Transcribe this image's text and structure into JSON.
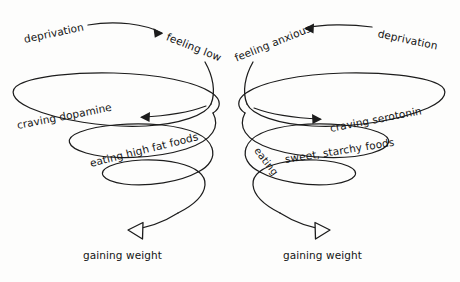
{
  "figure": {
    "background_color": "#fdfdfc",
    "ink_color": "#1c1c1c",
    "style": "hand-drawn line diagram"
  },
  "left_spiral": {
    "name": "dopamine-deprivation-spiral",
    "nodes": {
      "deprivation": "deprivation",
      "feeling_low": "feeling low",
      "craving": "craving dopamine",
      "eating": "eating high fat foods",
      "outcome": "gaining weight"
    },
    "sequence": [
      "deprivation",
      "feeling low",
      "craving dopamine",
      "eating high fat foods",
      "gaining weight"
    ]
  },
  "right_spiral": {
    "name": "serotonin-deprivation-spiral",
    "nodes": {
      "deprivation": "deprivation",
      "feeling_anxious": "feeling anxious",
      "craving": "craving serotonin",
      "eating_a": "eating",
      "eating_b": "sweet, starchy foods",
      "eating_full": "eating sweet, starchy foods",
      "outcome": "gaining weight"
    },
    "sequence": [
      "deprivation",
      "feeling anxious",
      "craving serotonin",
      "eating sweet, starchy foods",
      "gaining weight"
    ]
  },
  "arrows": {
    "head_style_inline": "solid-triangle",
    "head_style_terminal": "hollow-triangle"
  }
}
